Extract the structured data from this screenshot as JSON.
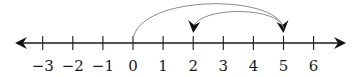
{
  "diagram": {
    "type": "number-line",
    "min": -3,
    "max": 6,
    "ticks": [
      {
        "value": -3,
        "label": "−3"
      },
      {
        "value": -2,
        "label": "−2"
      },
      {
        "value": -1,
        "label": "−1"
      },
      {
        "value": 0,
        "label": "0"
      },
      {
        "value": 1,
        "label": "1"
      },
      {
        "value": 2,
        "label": "2"
      },
      {
        "value": 3,
        "label": "3"
      },
      {
        "value": 4,
        "label": "4"
      },
      {
        "value": 5,
        "label": "5"
      },
      {
        "value": 6,
        "label": "6"
      }
    ],
    "jumps": [
      {
        "from": 0,
        "to": 5,
        "description": "jump of +5"
      },
      {
        "from": 5,
        "to": 2,
        "description": "jump of -3"
      }
    ],
    "colors": {
      "axis": "#1a1a1a",
      "jump_arc": "#8a8a8a",
      "arrowhead": "#111111"
    }
  }
}
